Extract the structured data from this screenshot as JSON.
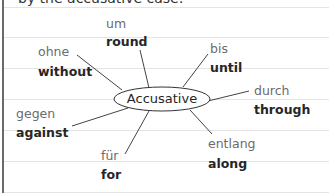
{
  "heading": "by the accusative case:",
  "center": "Accusative",
  "colors": {
    "german": "#6b6b6b",
    "english": "#262626",
    "rule": "#e4e4e4",
    "margin": "#6a6a6a"
  },
  "prepositions": [
    {
      "german": "um",
      "english": "round"
    },
    {
      "german": "bis",
      "english": "until"
    },
    {
      "german": "durch",
      "english": "through"
    },
    {
      "german": "entlang",
      "english": "along"
    },
    {
      "german": "für",
      "english": "for"
    },
    {
      "german": "gegen",
      "english": "against"
    },
    {
      "german": "ohne",
      "english": "without"
    }
  ]
}
